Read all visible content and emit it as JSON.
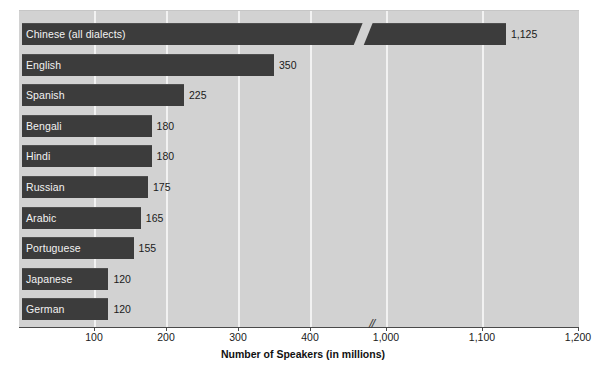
{
  "chart_data": {
    "type": "bar",
    "orientation": "horizontal",
    "title": "",
    "xlabel": "Number of Speakers (in millions)",
    "ylabel": "",
    "categories": [
      "Chinese (all dialects)",
      "English",
      "Spanish",
      "Bengali",
      "Hindi",
      "Russian",
      "Arabic",
      "Portuguese",
      "Japanese",
      "German"
    ],
    "values": [
      1125,
      350,
      225,
      180,
      180,
      175,
      165,
      155,
      120,
      120
    ],
    "value_labels": [
      "1,125",
      "350",
      "225",
      "180",
      "180",
      "175",
      "165",
      "155",
      "120",
      "120"
    ],
    "xticks": [
      100,
      200,
      300,
      400,
      1000,
      1100,
      1200
    ],
    "xtick_labels": [
      "100",
      "200",
      "300",
      "400",
      "1,000",
      "1,100",
      "1,200"
    ],
    "xlim": [
      0,
      1200
    ],
    "axis_break": {
      "present": true,
      "between": [
        400,
        1000
      ],
      "marker": "//"
    },
    "grid": true,
    "gridlines_at": [
      100,
      200,
      300,
      400,
      1000,
      1100
    ],
    "legend": "none",
    "colors": {
      "bar": "#3c3c3c",
      "panel_background": "#d2d2d2",
      "gridline": "#f2f2f2",
      "bar_label_text": "#f3f3f3",
      "value_label_text": "#1a1a1a",
      "axis_line": "#4a4a4a",
      "page_background": "#ffffff"
    }
  }
}
